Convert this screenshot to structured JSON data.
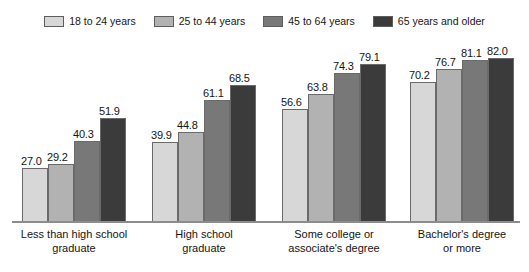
{
  "chart_data": {
    "type": "bar",
    "title": "",
    "subtitle": "",
    "xlabel": "",
    "ylabel": "",
    "ylim": [
      0,
      92
    ],
    "grid": false,
    "legend_position": "top-center",
    "value_format": "one-decimal",
    "categories": [
      "Less than high school graduate",
      "High school graduate",
      "Some college or associate's degree",
      "Bachelor's degree or more"
    ],
    "category_lines": [
      [
        "Less than high school",
        "graduate"
      ],
      [
        "High school",
        "graduate"
      ],
      [
        "Some college or",
        "associate's degree"
      ],
      [
        "Bachelor's degree",
        "or more"
      ]
    ],
    "series": [
      {
        "name": "18 to 24 years",
        "color": "#d7d7d7",
        "values": [
          27.0,
          39.9,
          56.6,
          70.2
        ],
        "labels": [
          "27.0",
          "39.9",
          "56.6",
          "70.2"
        ]
      },
      {
        "name": "25 to 44 years",
        "color": "#b2b2b2",
        "values": [
          29.2,
          44.8,
          63.8,
          76.7
        ],
        "labels": [
          "29.2",
          "44.8",
          "63.8",
          "76.7"
        ]
      },
      {
        "name": "45 to 64 years",
        "color": "#787878",
        "values": [
          40.3,
          61.1,
          74.3,
          81.1
        ],
        "labels": [
          "40.3",
          "61.1",
          "74.3",
          "81.1"
        ]
      },
      {
        "name": "65 years and older",
        "color": "#3b3b3b",
        "values": [
          51.9,
          68.5,
          79.1,
          82.0
        ],
        "labels": [
          "51.9",
          "68.5",
          "79.1",
          "82.0"
        ]
      }
    ]
  },
  "legend": {
    "items": [
      {
        "label": "18 to 24 years",
        "color": "#d7d7d7"
      },
      {
        "label": "25 to 44 years",
        "color": "#b2b2b2"
      },
      {
        "label": "45 to 64 years",
        "color": "#787878"
      },
      {
        "label": "65 years and older",
        "color": "#3b3b3b"
      }
    ]
  },
  "axis": {
    "baseline_color": "#8c8c8c"
  }
}
